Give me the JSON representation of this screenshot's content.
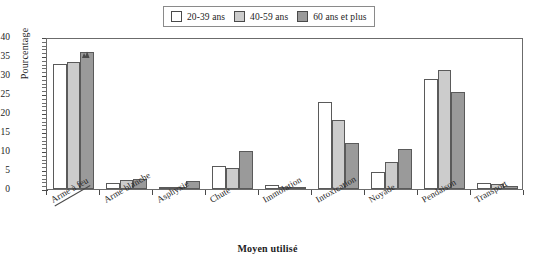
{
  "chart_data": {
    "type": "bar",
    "title": "",
    "xlabel": "Moyen utilisé",
    "ylabel": "Pourcentage",
    "ylim": [
      0,
      40
    ],
    "ytick_step": 5,
    "yticks": [
      "0",
      "5",
      "10",
      "15",
      "20",
      "25",
      "30",
      "35",
      "40"
    ],
    "grid": false,
    "legend_position": "top-center",
    "categories": [
      "Arme à feu",
      "Arme blanche",
      "Asphyxie",
      "Chute",
      "Immolation",
      "Intoxication",
      "Noyade",
      "Pendaison",
      "Transport"
    ],
    "series": [
      {
        "name": "20-39 ans",
        "color": "#ffffff",
        "values": [
          33.0,
          1.7,
          0.5,
          6.0,
          1.0,
          23.0,
          4.5,
          29.0,
          1.5
        ]
      },
      {
        "name": "40-59 ans",
        "color": "#cccccc",
        "values": [
          33.4,
          2.3,
          0.5,
          5.6,
          0.6,
          18.2,
          7.0,
          31.2,
          1.2
        ]
      },
      {
        "name": "60 ans et plus",
        "color": "#9a9a9a",
        "values": [
          36.0,
          2.7,
          2.1,
          10.0,
          0.6,
          12.0,
          10.5,
          25.4,
          0.7
        ]
      }
    ],
    "annotations": [
      {
        "name": "scan-artifact",
        "category": "Arme à feu",
        "series": "60 ans et plus"
      }
    ]
  },
  "legend": {
    "items": [
      {
        "label": "20-39 ans",
        "swatch": "#ffffff"
      },
      {
        "label": "40-59 ans",
        "swatch": "#cccccc"
      },
      {
        "label": "60 ans et plus",
        "swatch": "#9a9a9a"
      }
    ]
  },
  "axes": {
    "y_title": "Pourcentage",
    "x_title": "Moyen utilisé"
  },
  "style": {
    "bar_border": "#5a5a5a",
    "frame_color": "#6b6b6b",
    "text_color": "#1c1c1c",
    "background": "#ffffff"
  }
}
